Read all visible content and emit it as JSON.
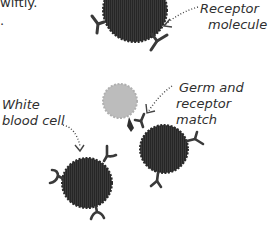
{
  "paragraph": {
    "line1": "wiftly.",
    "line2": "."
  },
  "labels": {
    "receptor": [
      "Receptor",
      "molecule"
    ],
    "germ": [
      "Germ and",
      "receptor match"
    ],
    "wbc": [
      "White",
      "blood cell"
    ]
  },
  "colors": {
    "cell": "#333333",
    "germ": "#bdbdbd",
    "receptor": "#3a3a3a",
    "text": "#2f2f2f"
  }
}
